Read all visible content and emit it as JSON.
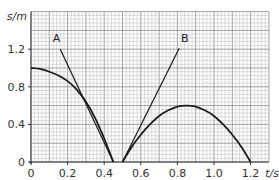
{
  "chart_data": {
    "type": "line",
    "title": "",
    "xlabel": "t/s",
    "ylabel": "s/m",
    "xlim": [
      0,
      1.3
    ],
    "ylim": [
      0,
      1.6
    ],
    "grid": true,
    "x_ticks": [
      "0",
      "0.2",
      "0.4",
      "0.6",
      "0.8",
      "1.0",
      "1.2"
    ],
    "y_ticks": [
      "0",
      "0.4",
      "0.8",
      "1.2"
    ],
    "series": [
      {
        "name": "curve-1",
        "kind": "curve",
        "x": [
          0,
          0.05,
          0.1,
          0.15,
          0.2,
          0.25,
          0.3,
          0.35,
          0.4,
          0.45
        ],
        "y": [
          1.0,
          0.99,
          0.96,
          0.92,
          0.86,
          0.77,
          0.64,
          0.47,
          0.25,
          0.0
        ]
      },
      {
        "name": "tangent-A",
        "kind": "line",
        "label": "A",
        "x": [
          0.16,
          0.45
        ],
        "y": [
          1.2,
          0.0
        ]
      },
      {
        "name": "curve-2",
        "kind": "curve",
        "x": [
          0.5,
          0.55,
          0.6,
          0.65,
          0.7,
          0.75,
          0.8,
          0.85,
          0.9,
          0.95,
          1.0,
          1.05,
          1.1,
          1.15,
          1.2
        ],
        "y": [
          0.0,
          0.16,
          0.29,
          0.4,
          0.49,
          0.55,
          0.59,
          0.6,
          0.59,
          0.55,
          0.49,
          0.4,
          0.29,
          0.16,
          0.0
        ]
      },
      {
        "name": "tangent-B",
        "kind": "line",
        "label": "B",
        "x": [
          0.5,
          0.81
        ],
        "y": [
          0.0,
          1.21
        ]
      }
    ],
    "annotations": [
      {
        "text": "A",
        "x": 0.14,
        "y": 1.28
      },
      {
        "text": "B",
        "x": 0.84,
        "y": 1.28
      }
    ]
  }
}
